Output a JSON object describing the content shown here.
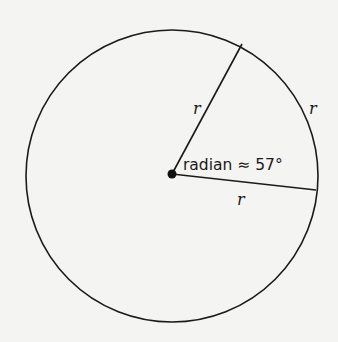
{
  "diagram": {
    "title": "",
    "background": "#f4f4f2",
    "stroke_color": "#1a1a1a",
    "circle": {
      "cx": 172,
      "cy": 175,
      "r": 147
    },
    "center_point": {
      "x": 172,
      "y": 174
    },
    "radius_endpoints": [
      {
        "x": 242,
        "y": 44
      },
      {
        "x": 316,
        "y": 190
      }
    ],
    "labels": {
      "upper_radius": "r",
      "arc": "r",
      "lower_radius": "r",
      "angle": "radian ≈ 57°"
    }
  }
}
